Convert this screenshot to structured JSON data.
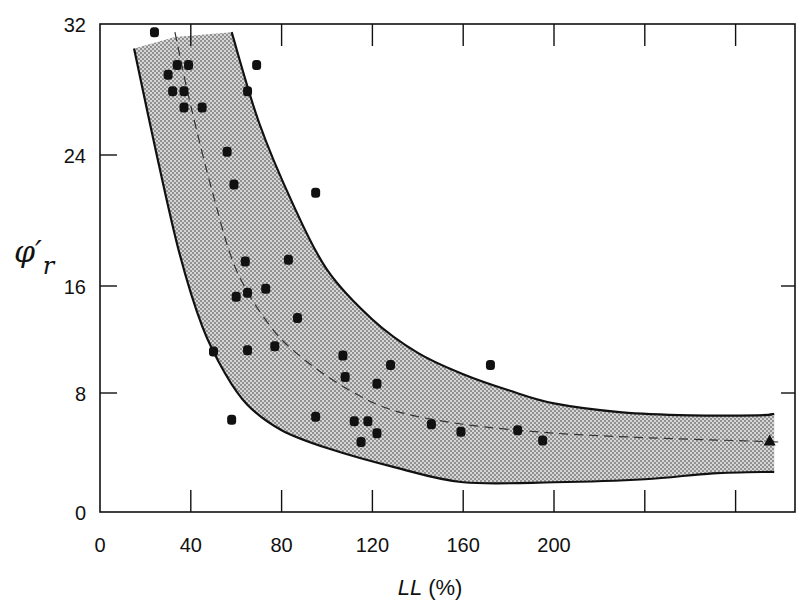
{
  "chart_data": {
    "type": "scatter",
    "title": "",
    "xlabel": "LL (%)",
    "xlabel_italic_part": "LL",
    "xlabel_unit": "(%)",
    "ylabel": "φ′r",
    "ylabel_symbol": "φ′",
    "ylabel_subscript": "r",
    "xlim": [
      0,
      305
    ],
    "ylim": [
      0,
      32
    ],
    "x_ticks": [
      0,
      40,
      80,
      120,
      160,
      200,
      240,
      280
    ],
    "x_tick_labels": [
      "0",
      "40",
      "80",
      "120",
      "160",
      "200",
      "",
      ""
    ],
    "y_ticks": [
      0,
      8,
      16,
      24,
      32
    ],
    "y_tick_labels": [
      "0",
      "8",
      "16",
      "24",
      "32"
    ],
    "grid": false,
    "legend": null,
    "series": [
      {
        "name": "measured points",
        "marker": "filled-circle",
        "points": [
          [
            24,
            31.5
          ],
          [
            30,
            28.9
          ],
          [
            34,
            29.5
          ],
          [
            39,
            29.5
          ],
          [
            69,
            29.5
          ],
          [
            32,
            27.9
          ],
          [
            37,
            27.9
          ],
          [
            37,
            26.9
          ],
          [
            45,
            26.9
          ],
          [
            65,
            27.9
          ],
          [
            56,
            24.2
          ],
          [
            59,
            22.2
          ],
          [
            95,
            21.7
          ],
          [
            64,
            17.5
          ],
          [
            83,
            17.6
          ],
          [
            73,
            15.8
          ],
          [
            60,
            15.2
          ],
          [
            65,
            15.5
          ],
          [
            87,
            13.6
          ],
          [
            50,
            11.1
          ],
          [
            65,
            11.2
          ],
          [
            77,
            11.5
          ],
          [
            107,
            10.8
          ],
          [
            108,
            9.2
          ],
          [
            128,
            10.1
          ],
          [
            172,
            10.1
          ],
          [
            122,
            8.7
          ],
          [
            58,
            6.2
          ],
          [
            95,
            6.4
          ],
          [
            112,
            6.1
          ],
          [
            118,
            6.1
          ],
          [
            122,
            5.3
          ],
          [
            115,
            4.7
          ],
          [
            146,
            5.9
          ],
          [
            159,
            5.4
          ],
          [
            184,
            5.5
          ],
          [
            195,
            4.8
          ]
        ]
      },
      {
        "name": "triangle point",
        "marker": "filled-triangle",
        "points": [
          [
            295,
            4.8
          ]
        ]
      },
      {
        "name": "upper bound",
        "type": "line",
        "style": "solid",
        "points": [
          [
            58,
            31.5
          ],
          [
            70,
            26
          ],
          [
            85,
            21
          ],
          [
            100,
            17
          ],
          [
            120,
            13.5
          ],
          [
            140,
            11
          ],
          [
            160,
            9.4
          ],
          [
            180,
            8.2
          ],
          [
            200,
            7.3
          ],
          [
            230,
            6.7
          ],
          [
            260,
            6.5
          ],
          [
            290,
            6.5
          ],
          [
            297,
            6.6
          ]
        ]
      },
      {
        "name": "lower bound",
        "type": "line",
        "style": "solid",
        "points": [
          [
            15,
            30.5
          ],
          [
            25,
            24
          ],
          [
            35,
            18
          ],
          [
            45,
            13
          ],
          [
            55,
            9.5
          ],
          [
            65,
            7.2
          ],
          [
            80,
            5.5
          ],
          [
            100,
            4.3
          ],
          [
            130,
            3
          ],
          [
            160,
            2
          ],
          [
            200,
            2
          ],
          [
            240,
            2.2
          ],
          [
            270,
            2.6
          ],
          [
            297,
            2.7
          ]
        ]
      },
      {
        "name": "mean trend",
        "type": "line",
        "style": "dashed",
        "points": [
          [
            33,
            31.5
          ],
          [
            40,
            27
          ],
          [
            50,
            21.5
          ],
          [
            60,
            17
          ],
          [
            75,
            13
          ],
          [
            90,
            10.5
          ],
          [
            110,
            8.2
          ],
          [
            130,
            6.8
          ],
          [
            160,
            5.9
          ],
          [
            200,
            5.3
          ],
          [
            240,
            5.0
          ],
          [
            280,
            4.8
          ],
          [
            300,
            4.7
          ]
        ]
      }
    ],
    "band": {
      "description": "stippled shaded envelope between upper and lower bounds",
      "fill": "#c8c8c8"
    }
  },
  "colors": {
    "ink": "#111111",
    "band_fill": "#bdbdbd",
    "band_dot": "#7a7a7a",
    "background": "#ffffff"
  }
}
